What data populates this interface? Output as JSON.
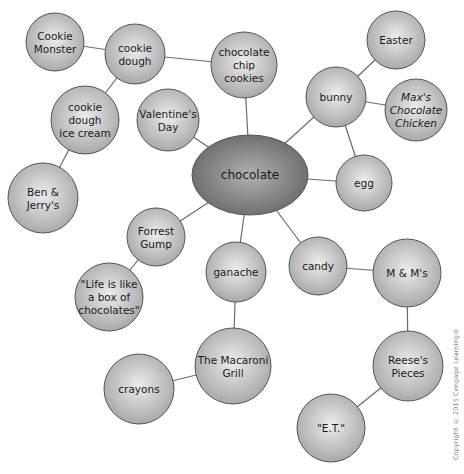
{
  "diagram": {
    "center": {
      "id": "chocolate",
      "lines": [
        "chocolate"
      ],
      "x": 250,
      "y": 175,
      "rx": 58,
      "ry": 40
    },
    "nodes": [
      {
        "id": "cookie-monster",
        "lines": [
          "Cookie",
          "Monster"
        ],
        "x": 55,
        "y": 42,
        "r": 29
      },
      {
        "id": "cookie-dough",
        "lines": [
          "cookie",
          "dough"
        ],
        "x": 135,
        "y": 54,
        "r": 30
      },
      {
        "id": "chocolate-chip-cookies",
        "lines": [
          "chocolate",
          "chip",
          "cookies"
        ],
        "x": 244,
        "y": 65,
        "r": 33
      },
      {
        "id": "cookie-dough-ice-cream",
        "lines": [
          "cookie",
          "dough",
          "ice cream"
        ],
        "x": 85,
        "y": 120,
        "r": 34
      },
      {
        "id": "valentines-day",
        "lines": [
          "Valentine's",
          "Day"
        ],
        "x": 168,
        "y": 120,
        "r": 31
      },
      {
        "id": "ben-and-jerrys",
        "lines": [
          "Ben &",
          "Jerry's"
        ],
        "x": 43,
        "y": 198,
        "r": 35
      },
      {
        "id": "easter",
        "lines": [
          "Easter"
        ],
        "x": 396,
        "y": 40,
        "r": 29
      },
      {
        "id": "bunny",
        "lines": [
          "bunny"
        ],
        "x": 336,
        "y": 97,
        "r": 30
      },
      {
        "id": "maxs-chocolate-chicken",
        "lines": [
          "Max's",
          "Chocolate",
          "Chicken"
        ],
        "x": 416,
        "y": 110,
        "r": 31,
        "italic": true
      },
      {
        "id": "egg",
        "lines": [
          "egg"
        ],
        "x": 364,
        "y": 183,
        "r": 28
      },
      {
        "id": "forrest-gump",
        "lines": [
          "Forrest",
          "Gump"
        ],
        "x": 156,
        "y": 237,
        "r": 29
      },
      {
        "id": "life-is-like",
        "lines": [
          "\"Life is like",
          "a box of",
          "chocolates\""
        ],
        "x": 109,
        "y": 297,
        "r": 34
      },
      {
        "id": "ganache",
        "lines": [
          "ganache"
        ],
        "x": 236,
        "y": 272,
        "r": 30
      },
      {
        "id": "candy",
        "lines": [
          "candy"
        ],
        "x": 318,
        "y": 266,
        "r": 29
      },
      {
        "id": "m-and-ms",
        "lines": [
          "M & M's"
        ],
        "x": 407,
        "y": 273,
        "r": 34
      },
      {
        "id": "macaroni-grill",
        "lines": [
          "The Macaroni",
          "Grill"
        ],
        "x": 233,
        "y": 366,
        "r": 38
      },
      {
        "id": "crayons",
        "lines": [
          "crayons"
        ],
        "x": 139,
        "y": 389,
        "r": 35
      },
      {
        "id": "reeses-pieces",
        "lines": [
          "Reese's",
          "Pieces"
        ],
        "x": 408,
        "y": 366,
        "r": 35
      },
      {
        "id": "et",
        "lines": [
          "\"E.T.\""
        ],
        "x": 331,
        "y": 428,
        "r": 34
      }
    ],
    "edges": [
      [
        "cookie-monster",
        "cookie-dough"
      ],
      [
        "cookie-dough",
        "chocolate-chip-cookies"
      ],
      [
        "cookie-dough",
        "cookie-dough-ice-cream"
      ],
      [
        "cookie-dough-ice-cream",
        "ben-and-jerrys"
      ],
      [
        "chocolate-chip-cookies",
        "chocolate"
      ],
      [
        "valentines-day",
        "chocolate"
      ],
      [
        "bunny",
        "chocolate"
      ],
      [
        "bunny",
        "easter"
      ],
      [
        "bunny",
        "maxs-chocolate-chicken"
      ],
      [
        "bunny",
        "egg"
      ],
      [
        "egg",
        "chocolate"
      ],
      [
        "forrest-gump",
        "chocolate"
      ],
      [
        "forrest-gump",
        "life-is-like"
      ],
      [
        "ganache",
        "chocolate"
      ],
      [
        "ganache",
        "macaroni-grill"
      ],
      [
        "macaroni-grill",
        "crayons"
      ],
      [
        "candy",
        "chocolate"
      ],
      [
        "candy",
        "m-and-ms"
      ],
      [
        "m-and-ms",
        "reeses-pieces"
      ],
      [
        "reeses-pieces",
        "et"
      ]
    ],
    "colors": {
      "node_fill_light": "#e6e6e6",
      "node_fill_dark": "#a9a9a9",
      "center_fill_light": "#a8a8a8",
      "center_fill_dark": "#6e6e6e",
      "edge": "#6b6b6b",
      "text": "#1a1a1a"
    }
  },
  "copyright": "Copyright © 2015 Cengage Learning®"
}
